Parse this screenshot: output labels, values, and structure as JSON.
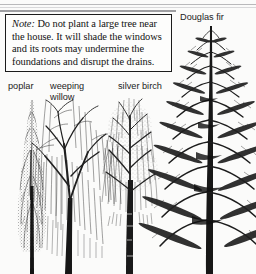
{
  "page": {
    "background_color": "#fbfbfa",
    "ink_color": "#111111"
  },
  "note": {
    "lead": "Note:",
    "body": " Do not plant a large tree near the house. It will shade the windows and its roots may undermine the foundations and disrupt the drains."
  },
  "labels": {
    "poplar": "poplar",
    "weeping_willow": "weeping willow",
    "silver_birch": "silver birch",
    "douglas_fir": "Douglas fir"
  },
  "illustration": {
    "caption_font": "sans-serif",
    "trees": [
      {
        "name": "poplar",
        "form": "narrow columnar spire",
        "label": "poplar"
      },
      {
        "name": "weeping willow",
        "form": "broad dome with long pendulous branches",
        "label": "weeping willow"
      },
      {
        "name": "silver birch",
        "form": "slender upright with fine drooping twigs",
        "label": "silver birch"
      },
      {
        "name": "douglas fir",
        "form": "tall conical conifer with horizontal layered branches",
        "label": "Douglas fir"
      }
    ]
  }
}
